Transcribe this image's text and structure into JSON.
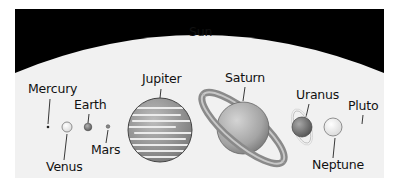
{
  "diagram": {
    "title": "Sun",
    "colors": {
      "background": "#000000",
      "sun": "#f1f1f1",
      "label": "#111111"
    },
    "planets": [
      {
        "name": "Mercury",
        "label": "Mercury"
      },
      {
        "name": "Venus",
        "label": "Venus"
      },
      {
        "name": "Earth",
        "label": "Earth"
      },
      {
        "name": "Mars",
        "label": "Mars"
      },
      {
        "name": "Jupiter",
        "label": "Jupiter"
      },
      {
        "name": "Saturn",
        "label": "Saturn"
      },
      {
        "name": "Uranus",
        "label": "Uranus"
      },
      {
        "name": "Neptune",
        "label": "Neptune"
      },
      {
        "name": "Pluto",
        "label": "Pluto"
      }
    ]
  }
}
